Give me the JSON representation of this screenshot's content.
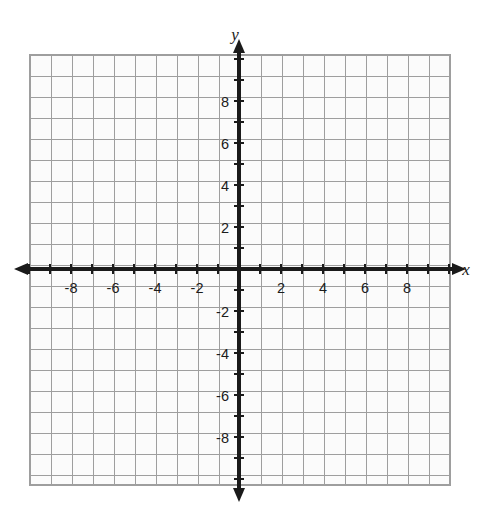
{
  "figure": {
    "kind": "cartesian-coordinate-grid",
    "background_color": "#ffffff"
  },
  "axis_labels": {
    "x": "x",
    "y": "y"
  },
  "colors": {
    "grid_line": "#9e9e9e",
    "grid_background": "#fbfbfb",
    "axis": "#1a1a1a",
    "tick_label": "#1c1c1c"
  },
  "chart_data": {
    "type": "scatter",
    "title": "",
    "subtitle": "",
    "xlabel": "x",
    "ylabel": "y",
    "xlim": [
      -10,
      10
    ],
    "ylim": [
      -10,
      10
    ],
    "grid": true,
    "grid_step": 1,
    "tick_step": 1,
    "label_step": 2,
    "legend": null,
    "annotations": [],
    "series": [],
    "x_tick_labels": [
      "-8",
      "-6",
      "-4",
      "-2",
      "2",
      "4",
      "6",
      "8"
    ],
    "x_tick_values": [
      -8,
      -6,
      -4,
      -2,
      2,
      4,
      6,
      8
    ],
    "y_tick_labels": [
      "8",
      "6",
      "4",
      "2",
      "-2",
      "-4",
      "-6",
      "-8"
    ],
    "y_tick_values": [
      8,
      6,
      4,
      2,
      -2,
      -4,
      -6,
      -8
    ],
    "x_minor_ticks": [
      -10,
      -9,
      -8,
      -7,
      -6,
      -5,
      -4,
      -3,
      -2,
      -1,
      1,
      2,
      3,
      4,
      5,
      6,
      7,
      8,
      9,
      10
    ],
    "y_minor_ticks": [
      -10,
      -9,
      -8,
      -7,
      -6,
      -5,
      -4,
      -3,
      -2,
      -1,
      1,
      2,
      3,
      4,
      5,
      6,
      7,
      8,
      9,
      10
    ],
    "origin_label": "",
    "values": [],
    "categories": []
  },
  "geometry": {
    "grid_left": 30,
    "grid_top": 55,
    "grid_right": 450,
    "grid_bottom": 485,
    "origin_x": 239,
    "origin_y": 269,
    "unit_px": 21,
    "cols": 20,
    "rows": 20
  }
}
